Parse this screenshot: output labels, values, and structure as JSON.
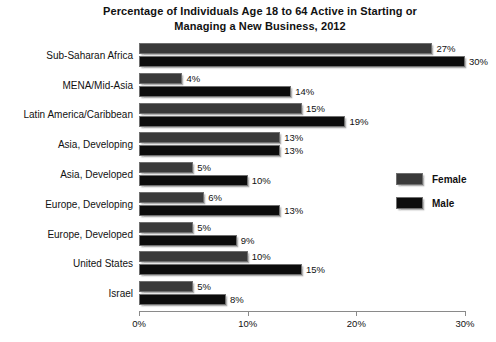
{
  "chart_data": {
    "type": "bar",
    "orientation": "horizontal",
    "title": "Percentage of Individuals Age 18 to 64 Active in Starting or Managing a New Business, 2012",
    "title_lines": [
      "Percentage of Individuals Age 18 to 64 Active in Starting or",
      "Managing a New Business, 2012"
    ],
    "xlabel": "",
    "ylabel": "",
    "xlim": [
      0,
      30
    ],
    "xticks": [
      0,
      10,
      20,
      30
    ],
    "xtick_labels": [
      "0%",
      "10%",
      "20%",
      "30%"
    ],
    "grid": false,
    "legend_position": "right-middle",
    "categories": [
      "Sub-Saharan Africa",
      "MENA/Mid-Asia",
      "Latin America/Caribbean",
      "Asia, Developing",
      "Asia, Developed",
      "Europe, Developing",
      "Europe, Developed",
      "United States",
      "Israel"
    ],
    "series": [
      {
        "name": "Female",
        "color": "#3a3a3a",
        "values": [
          27,
          4,
          15,
          13,
          5,
          6,
          5,
          10,
          5
        ],
        "value_labels": [
          "27%",
          "4%",
          "15%",
          "13%",
          "5%",
          "6%",
          "5%",
          "10%",
          "5%"
        ]
      },
      {
        "name": "Male",
        "color": "#0c0c0c",
        "values": [
          30,
          14,
          19,
          13,
          10,
          13,
          9,
          15,
          8
        ],
        "value_labels": [
          "30%",
          "14%",
          "19%",
          "13%",
          "10%",
          "13%",
          "9%",
          "15%",
          "8%"
        ]
      }
    ]
  },
  "legend": {
    "items": [
      {
        "label": "Female"
      },
      {
        "label": "Male"
      }
    ]
  }
}
